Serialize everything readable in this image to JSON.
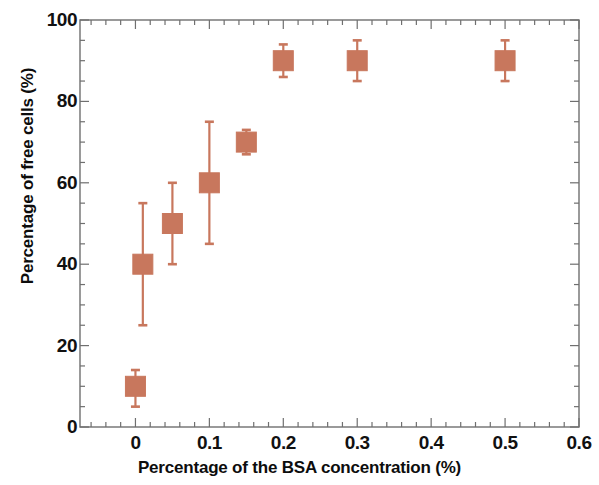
{
  "chart_data": {
    "type": "scatter",
    "title": "",
    "subtitle": "",
    "xlabel": "Percentage of the BSA concentration (%)",
    "ylabel": "Percentage of free cells (%)",
    "xlim": [
      -0.075,
      0.6
    ],
    "ylim": [
      0,
      100
    ],
    "xticks": [
      0,
      0.1,
      0.2,
      0.3,
      0.4,
      0.5,
      0.6
    ],
    "xtick_labels": [
      "0",
      "0.1",
      "0.2",
      "0.3",
      "0.4",
      "0.5",
      "0.6"
    ],
    "yticks": [
      0,
      20,
      40,
      60,
      80,
      100
    ],
    "ytick_labels": [
      "0",
      "20",
      "40",
      "60",
      "80",
      "100"
    ],
    "x_minor_tick_interval": 0.02,
    "y_minor_tick_interval": 5,
    "grid": false,
    "legend": null,
    "marker": "square",
    "marker_color": "#c8775d",
    "errorbar_color": "#c8775d",
    "axis_color": "#6f6f6f",
    "series": [
      {
        "name": "Percentage of free cells",
        "points": [
          {
            "x": 0.0,
            "y": 10,
            "yerr_low": 5,
            "yerr_high": 4
          },
          {
            "x": 0.01,
            "y": 40,
            "yerr_low": 15,
            "yerr_high": 15
          },
          {
            "x": 0.05,
            "y": 50,
            "yerr_low": 10,
            "yerr_high": 10
          },
          {
            "x": 0.1,
            "y": 60,
            "yerr_low": 15,
            "yerr_high": 15
          },
          {
            "x": 0.15,
            "y": 70,
            "yerr_low": 3,
            "yerr_high": 3
          },
          {
            "x": 0.2,
            "y": 90,
            "yerr_low": 4,
            "yerr_high": 4
          },
          {
            "x": 0.3,
            "y": 90,
            "yerr_low": 5,
            "yerr_high": 5
          },
          {
            "x": 0.5,
            "y": 90,
            "yerr_low": 5,
            "yerr_high": 5
          }
        ]
      }
    ]
  },
  "axis": {
    "y_labels": [
      "100",
      "80",
      "60",
      "40",
      "20",
      "0"
    ],
    "x_labels": [
      "0",
      "0.1",
      "0.2",
      "0.3",
      "0.4",
      "0.5",
      "0.6"
    ],
    "x_title": "Percentage of the BSA concentration (%)",
    "y_title": "Percentage of free cells (%)"
  }
}
